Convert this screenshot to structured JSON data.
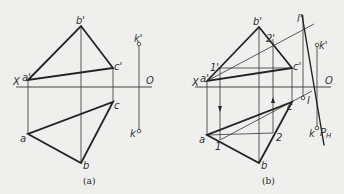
{
  "figure_a": {
    "caption": "(a)",
    "labels": {
      "X": "X",
      "O": "O",
      "a_prime": "a'",
      "b_prime": "b'",
      "c_prime": "c'",
      "a": "a",
      "b": "b",
      "c": "c",
      "k_prime": "k'",
      "k": "k"
    }
  },
  "figure_b": {
    "caption": "(b)",
    "labels": {
      "X": "X",
      "O": "O",
      "a_prime": "a'",
      "b_prime": "b'",
      "c_prime": "c'",
      "a": "a",
      "b": "b",
      "c": "c",
      "one_prime": "1'",
      "two_prime": "2'",
      "one": "1",
      "two": "2",
      "l_prime": "l'",
      "l": "l",
      "k_prime": "k'",
      "k": "k",
      "PH": "P",
      "PH_sub": "H"
    }
  }
}
